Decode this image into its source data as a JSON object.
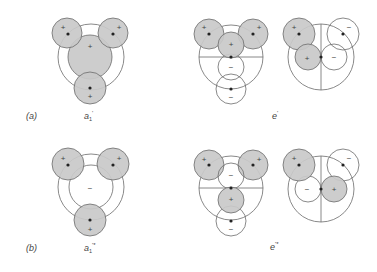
{
  "figure": {
    "rows": [
      {
        "panel_label": "(a)",
        "diagrams": [
          {
            "name": "a1-prime",
            "label_base": "a",
            "label_sub": "1",
            "label_sup": "'",
            "signs": {
              "upper_left": "+",
              "upper_right": "+",
              "center": "+",
              "bottom": "+"
            }
          },
          {
            "name": "e-prime",
            "label_base": "e",
            "label_sup": "'",
            "left_signs": {
              "upper_left": "+",
              "upper_right": "+",
              "middle_upper": "+",
              "middle_lower": "−",
              "bottom": "−"
            },
            "right_signs": {
              "upper_left": "+",
              "upper_right": "−",
              "lower_left": "+",
              "lower_right": "−"
            }
          }
        ]
      },
      {
        "panel_label": "(b)",
        "diagrams": [
          {
            "name": "a1-prime-star",
            "label_base": "a",
            "label_sub": "1",
            "label_sup": "'*",
            "signs": {
              "upper_left": "+",
              "upper_right": "+",
              "center": "−",
              "bottom": "+"
            }
          },
          {
            "name": "e-prime-star",
            "label_base": "e",
            "label_sup": "'*",
            "left_signs": {
              "upper_left": "+",
              "upper_right": "+",
              "middle_upper": "−",
              "middle_lower": "+",
              "bottom": "−"
            },
            "right_signs": {
              "upper_left": "+",
              "upper_right": "−",
              "lower_left": "−",
              "lower_right": "+"
            }
          }
        ]
      }
    ],
    "colors": {
      "positive_lobe": "#c9c9c9",
      "negative_lobe": "#ffffff",
      "outline": "#6b6b6b",
      "dot": "#222222"
    }
  }
}
